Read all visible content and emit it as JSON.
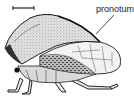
{
  "figure": {
    "labels": [
      {
        "text": "pronotum",
        "x": 96,
        "y": 5
      }
    ],
    "scale_bar": {
      "x1": 13,
      "x2": 34,
      "y": 8
    },
    "colors": {
      "ink": "#1e1e1e",
      "stipple": "#6a6a6a",
      "wing_fill": "#f2f2f2",
      "background": "#ffffff"
    }
  }
}
